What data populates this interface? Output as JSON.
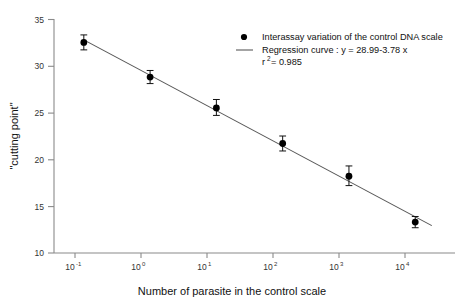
{
  "chart_data": {
    "type": "scatter",
    "title": "",
    "xlabel": "Number of parasite in the control scale",
    "ylabel": "\"cutting point\"",
    "xscale": "log",
    "xlim": [
      -1.45,
      4.6
    ],
    "ylim": [
      10,
      35
    ],
    "grid": false,
    "x_tick_labels": [
      "10-1",
      "100",
      "101",
      "102",
      "103",
      "104"
    ],
    "x_tick_base": [
      "10",
      "10",
      "10",
      "10",
      "10",
      "10"
    ],
    "x_tick_exponent": [
      "-1",
      "0",
      "1",
      "2",
      "3",
      "4"
    ],
    "x_tick_values": [
      -1,
      0,
      1,
      2,
      3,
      4
    ],
    "y_tick_labels": [
      "10",
      "15",
      "20",
      "25",
      "30",
      "35"
    ],
    "y_tick_values": [
      10,
      15,
      20,
      25,
      30,
      35
    ],
    "series": [
      {
        "name": "Interassay variation of the control DNA scale",
        "marker": "filled-circle",
        "color": "#000000",
        "x_log10": [
          -1,
          0,
          1,
          2,
          3,
          4
        ],
        "x_values": [
          0.1,
          1,
          10,
          100,
          1000,
          10000
        ],
        "values": [
          32.5,
          28.8,
          25.5,
          21.7,
          18.2,
          13.3
        ],
        "error_low": [
          0.8,
          0.7,
          0.8,
          0.8,
          1.0,
          0.6
        ],
        "error_high": [
          0.8,
          0.7,
          0.9,
          0.8,
          1.1,
          0.6
        ]
      },
      {
        "name": "Regression curve : y = 28.99-3.78 x",
        "marker": "line",
        "color": "#555555",
        "intercept": 28.99,
        "slope": -3.78,
        "x_log10_range": [
          -1,
          4.25
        ],
        "r_squared": 0.985
      }
    ],
    "annotations": [
      "r2 = 0.985"
    ]
  },
  "legend": {
    "position": "top-right",
    "entries": [
      {
        "marker": "filled-circle",
        "label": "Interassay variation of the control DNA scale"
      },
      {
        "marker": "line",
        "label": "Regression curve : y = 28.99-3.78 x"
      }
    ],
    "r_squared_prefix": "r",
    "r_squared_sup": "2",
    "r_squared_value": " = 0.985"
  },
  "axes": {
    "y_title": "\"cutting point\"",
    "x_title": "Number of parasite in the control scale",
    "y_ticks": [
      "35",
      "30",
      "25",
      "20",
      "15",
      "10"
    ],
    "x_ticks": [
      {
        "base": "10",
        "exp": "-1"
      },
      {
        "base": "10",
        "exp": "0"
      },
      {
        "base": "10",
        "exp": "1"
      },
      {
        "base": "10",
        "exp": "2"
      },
      {
        "base": "10",
        "exp": "3"
      },
      {
        "base": "10",
        "exp": "4"
      }
    ]
  },
  "colors": {
    "background": "#ffffff",
    "axis": "#8a8a8a",
    "marker": "#000000",
    "regression_line": "#5a5a5a",
    "text": "#111111"
  }
}
